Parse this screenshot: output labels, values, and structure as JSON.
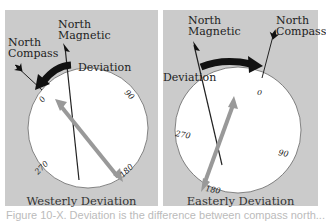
{
  "panels": [
    {
      "labels": {
        "north_magnetic": [
          "North",
          "Magnetic"
        ],
        "north_compass": [
          "North",
          "Compass"
        ],
        "deviation": "Deviation"
      },
      "dial_ticks": [
        "0",
        "90",
        "180",
        "270"
      ],
      "caption": "Westerly Deviation"
    },
    {
      "labels": {
        "north_magnetic": [
          "North",
          "Magnetic"
        ],
        "north_compass": [
          "North",
          "Compass"
        ],
        "deviation": "Deviation"
      },
      "dial_ticks": [
        "0",
        "90",
        "180",
        "270"
      ],
      "caption": "Easterly Deviation"
    }
  ],
  "figure_caption": "Figure 10-X.  Deviation is the difference between compass north..."
}
